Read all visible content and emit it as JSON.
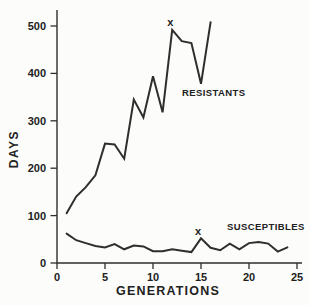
{
  "chart_data": {
    "type": "line",
    "xlabel": "GENERATIONS",
    "ylabel": "DAYS",
    "x_ticks": [
      0,
      5,
      10,
      15,
      20,
      25
    ],
    "y_ticks": [
      0,
      100,
      200,
      300,
      400,
      500
    ],
    "xlim": [
      0,
      25.5
    ],
    "ylim": [
      0,
      535
    ],
    "grid": false,
    "legend_position": "inline-labels",
    "line_color": "#2e2e2e",
    "background_color": "#fcfcfb",
    "series": [
      {
        "name": "RESISTANTS",
        "x": [
          1,
          2,
          3,
          4,
          5,
          6,
          7,
          8,
          9,
          10,
          11,
          12,
          13,
          14,
          15,
          16
        ],
        "values": [
          105,
          140,
          160,
          185,
          252,
          250,
          220,
          345,
          307,
          394,
          318,
          492,
          468,
          464,
          378,
          508
        ],
        "label_anchor": {
          "gen": 13.0,
          "days": 361
        }
      },
      {
        "name": "SUSCEPTIBLES",
        "x": [
          1,
          2,
          3,
          4,
          5,
          6,
          7,
          8,
          9,
          10,
          11,
          12,
          13,
          14,
          15,
          16,
          17,
          18,
          19,
          20,
          21,
          22,
          23,
          24
        ],
        "values": [
          62,
          48,
          42,
          36,
          33,
          40,
          29,
          37,
          35,
          25,
          25,
          29,
          26,
          23,
          52,
          32,
          27,
          41,
          29,
          42,
          44,
          41,
          24,
          33
        ],
        "label_anchor": {
          "gen": 17.7,
          "days": 78
        }
      }
    ],
    "annotations": [
      {
        "label": "x",
        "gen": 11.8,
        "days": 500
      },
      {
        "label": "x",
        "gen": 14.7,
        "days": 59
      }
    ]
  }
}
